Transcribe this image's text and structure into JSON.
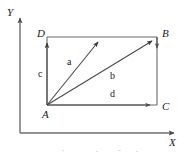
{
  "figure": {
    "type": "vector-diagram",
    "background_color": "#ffffff",
    "line_color": "#6a6a6a",
    "text_color": "#1a1a1a",
    "axes": {
      "x_label": "X",
      "y_label": "Y",
      "origin": {
        "x": 20,
        "y": 133
      },
      "x_axis_end": {
        "x": 178,
        "y": 133
      },
      "y_axis_end": {
        "x": 20,
        "y": 14
      }
    },
    "vertices": [
      {
        "name": "A",
        "label": "A",
        "x": 47,
        "y": 105,
        "label_x": 44,
        "label_y": 116
      },
      {
        "name": "B",
        "label": "B",
        "x": 157,
        "y": 37,
        "label_x": 162,
        "label_y": 35
      },
      {
        "name": "C",
        "label": "C",
        "x": 157,
        "y": 105,
        "label_x": 162,
        "label_y": 108
      },
      {
        "name": "D",
        "label": "D",
        "x": 47,
        "y": 37,
        "label_x": 38,
        "label_y": 35
      }
    ],
    "rectangle_edges": [
      {
        "name": "edge-DB",
        "from": "D",
        "to": "B"
      },
      {
        "name": "edge-BC",
        "from": "B",
        "to": "C"
      },
      {
        "name": "edge-AC",
        "from": "A",
        "to": "C"
      },
      {
        "name": "edge-AD",
        "from": "A",
        "to": "D"
      }
    ],
    "vectors": [
      {
        "name": "c",
        "label": "c",
        "from": {
          "x": 47,
          "y": 105
        },
        "to": {
          "x": 47,
          "y": 38
        },
        "label_x": 40,
        "label_y": 73
      },
      {
        "name": "a",
        "label": "a",
        "from": {
          "x": 47,
          "y": 105
        },
        "to": {
          "x": 101,
          "y": 38
        },
        "label_x": 68,
        "label_y": 62
      },
      {
        "name": "b",
        "label": "b",
        "from": {
          "x": 47,
          "y": 105
        },
        "to": {
          "x": 156,
          "y": 38
        },
        "label_x": 111,
        "label_y": 75
      },
      {
        "name": "d",
        "label": "d",
        "from": {
          "x": 47,
          "y": 105
        },
        "to": {
          "x": 155,
          "y": 105
        },
        "label_x": 111,
        "label_y": 95
      }
    ]
  }
}
